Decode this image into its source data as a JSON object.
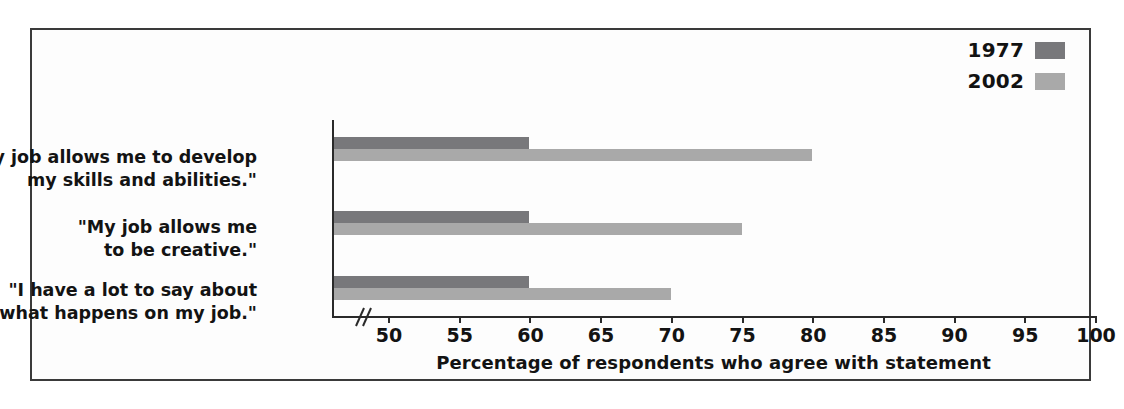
{
  "chart_data": {
    "type": "bar",
    "orientation": "horizontal",
    "title": "",
    "xlabel": "Percentage of respondents who agree with statement",
    "ylabel": "",
    "xlim": [
      48,
      100
    ],
    "axis_break": true,
    "grid": false,
    "legend_position": "top-right",
    "categories": [
      "\"My job allows me to develop\nmy skills and abilities.\"",
      "\"My job allows me\nto be creative.\"",
      "\"I have a lot to say about\nwhat happens on my job.\""
    ],
    "series": [
      {
        "name": "1977",
        "color": "#78787b",
        "values": [
          60,
          60,
          60
        ]
      },
      {
        "name": "2002",
        "color": "#a9a9a9",
        "values": [
          80,
          75,
          70
        ]
      }
    ],
    "tick_labels": [
      "50",
      "55",
      "60",
      "65",
      "70",
      "75",
      "80",
      "85",
      "90",
      "95",
      "100"
    ],
    "tick_values": [
      50,
      55,
      60,
      65,
      70,
      75,
      80,
      85,
      90,
      95,
      100
    ]
  },
  "legend": {
    "items": [
      {
        "label": "1977",
        "color": "#78787b"
      },
      {
        "label": "2002",
        "color": "#a9a9a9"
      }
    ]
  },
  "axis": {
    "title": "Percentage of respondents who agree with statement",
    "break_icon": "axis-break-icon"
  }
}
